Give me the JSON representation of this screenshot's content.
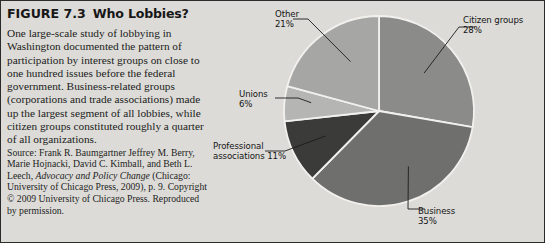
{
  "figure": {
    "number": "FIGURE 7.3",
    "title": "Who Lobbies?",
    "body": "One large-scale study of lobbying in Washington documented the pattern of participation by interest groups on close to one hundred issues before the federal government. Business-related groups (corporations and trade associations) made up the largest segment of all lobbies, while citizen groups constituted roughly a quarter of all organizations.",
    "source_prefix": "Source: Frank R. Baumgartner Jeffrey M. Berry, Marie Hojnacki, David C. Kimball, and Beth L. Leech, ",
    "source_italic": "Advocacy and Policy Change",
    "source_suffix": " (Chicago: University of Chicago Press, 2009), p. 9. Copyright © 2009 University of Chicago Press. Reproduced by permission."
  },
  "chart_data": {
    "type": "pie",
    "title": "Who Lobbies?",
    "xlabel": "",
    "ylabel": "",
    "grid": false,
    "legend_position": "callout-labels",
    "start_angle_deg": 0,
    "direction": "clockwise",
    "categories": [
      "Citizen groups",
      "Business",
      "Professional associations",
      "Unions",
      "Other"
    ],
    "values": [
      28,
      35,
      11,
      6,
      21
    ],
    "unit": "percent",
    "slices": [
      {
        "label": "Citizen groups",
        "value": 28,
        "value_text": "28%",
        "color": "#8b8b8a"
      },
      {
        "label": "Business",
        "value": 35,
        "value_text": "35%",
        "color": "#6f6f6e"
      },
      {
        "label": "Professional associations",
        "value": 11,
        "value_text": "11%",
        "color": "#3b3b3a"
      },
      {
        "label": "Unions",
        "value": 6,
        "value_text": "6%",
        "color": "#b5b5b3"
      },
      {
        "label": "Other",
        "value": 21,
        "value_text": "21%",
        "color": "#a6a6a4"
      }
    ],
    "labels": {
      "citizen_name": "Citizen groups",
      "citizen_pct": "28%",
      "business_name": "Business",
      "business_pct": "35%",
      "prof_line1": "Professional",
      "prof_line2": "associations 11%",
      "unions_name": "Unions",
      "unions_pct": "6%",
      "other_name": "Other",
      "other_pct": "21%"
    },
    "separator_color": "#f2f1ee",
    "background_color": "#dcdbd7"
  }
}
